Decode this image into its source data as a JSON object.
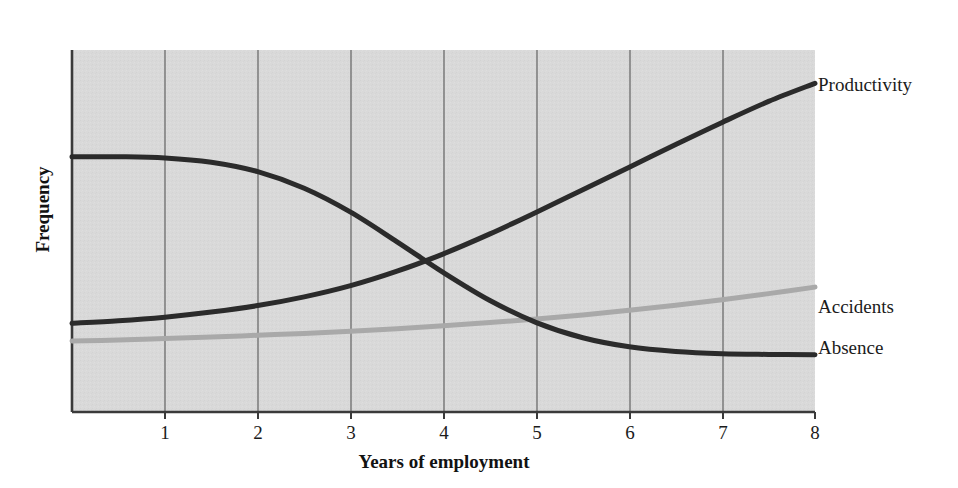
{
  "chart_data": {
    "type": "line",
    "title": "",
    "xlabel": "Years of employment",
    "ylabel": "Frequency",
    "xlim": [
      0,
      8
    ],
    "ylim": [
      0,
      1
    ],
    "xticks": [
      "1",
      "2",
      "3",
      "4",
      "5",
      "6",
      "7",
      "8"
    ],
    "yticks": [],
    "grid": "vertical",
    "legend_position": "right-inline-labels",
    "x": [
      0,
      0.5,
      1,
      1.5,
      2,
      2.5,
      3,
      3.5,
      4,
      4.5,
      5,
      5.5,
      6,
      6.5,
      7,
      7.5,
      8
    ],
    "series": [
      {
        "name": "Productivity",
        "label": "Productivity",
        "color": "#2b2b2b",
        "stroke_width": 5,
        "values": [
          0.245,
          0.252,
          0.262,
          0.276,
          0.294,
          0.318,
          0.349,
          0.389,
          0.437,
          0.492,
          0.552,
          0.614,
          0.676,
          0.739,
          0.8,
          0.858,
          0.908
        ]
      },
      {
        "name": "Absence",
        "label": "Absence",
        "color": "#2b2b2b",
        "stroke_width": 5,
        "values": [
          0.705,
          0.705,
          0.702,
          0.69,
          0.664,
          0.618,
          0.552,
          0.47,
          0.385,
          0.308,
          0.247,
          0.205,
          0.18,
          0.167,
          0.161,
          0.159,
          0.158
        ]
      },
      {
        "name": "Accidents",
        "label": "Accidents",
        "color": "#a9a9a9",
        "stroke_width": 5,
        "values": [
          0.196,
          0.199,
          0.203,
          0.207,
          0.212,
          0.217,
          0.223,
          0.23,
          0.238,
          0.247,
          0.257,
          0.268,
          0.281,
          0.295,
          0.31,
          0.327,
          0.345
        ]
      }
    ]
  },
  "labels": {
    "productivity": "Productivity",
    "accidents": "Accidents",
    "absence": "Absence",
    "xaxis_title": "Years of employment",
    "yaxis_title": "Frequency",
    "tick_1": "1",
    "tick_2": "2",
    "tick_3": "3",
    "tick_4": "4",
    "tick_5": "5",
    "tick_6": "6",
    "tick_7": "7",
    "tick_8": "8"
  },
  "colors": {
    "plot_background": "#d9d9d9",
    "axis": "#3a3a3a",
    "gridline": "#6b6b6b",
    "dark_series": "#2b2b2b",
    "light_series": "#a9a9a9",
    "text": "#1b1b1b",
    "page_background": "#ffffff"
  }
}
